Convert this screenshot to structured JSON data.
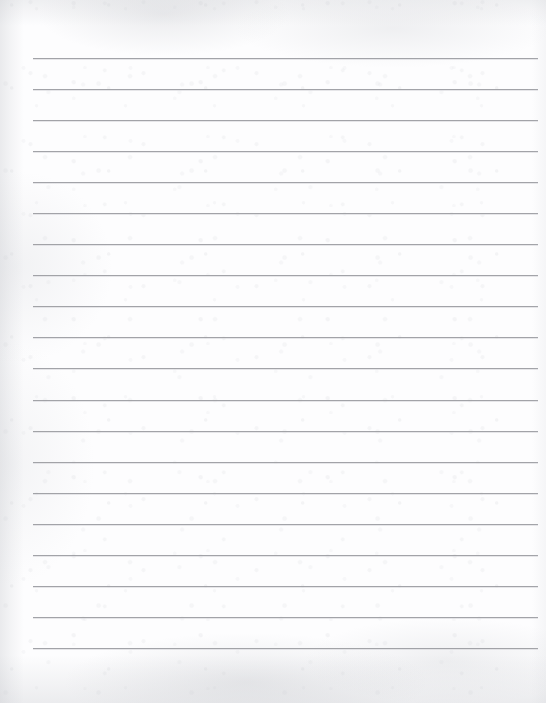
{
  "document": {
    "kind": "scanned-ruled-notebook-paper",
    "title": "Blank ruled paper",
    "page_width": 546,
    "page_height": 703,
    "text_content": "",
    "has_writing": false,
    "has_header": false,
    "has_page_number": false
  },
  "paper": {
    "background_color": "#fdfdfe",
    "edge_shadow_color": "#c4c6cb",
    "texture": "mottled scan grain"
  },
  "ruling": {
    "line_color": "#9b9ca1",
    "line_highlight_color": "#d8d9dd",
    "line_thickness": 1,
    "line_count": 20,
    "left_x": 33,
    "right_x": 538,
    "first_line_y": 58,
    "spacing": 31.05,
    "margin_rule": false,
    "lines_y": [
      58,
      89,
      120,
      151,
      182,
      213,
      244,
      275,
      306,
      337,
      368,
      400,
      431,
      462,
      493,
      524,
      555,
      586,
      617,
      648
    ]
  }
}
